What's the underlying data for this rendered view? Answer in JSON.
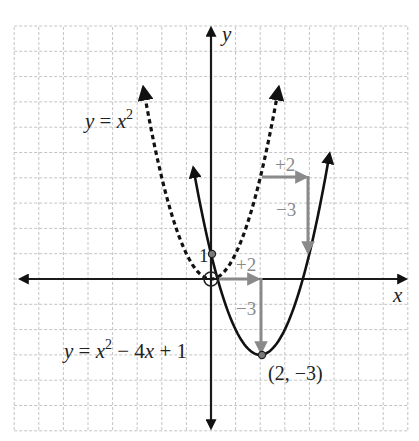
{
  "figure": {
    "axes": {
      "x_label": "x",
      "y_label": "y",
      "x_range": [
        -8,
        8
      ],
      "y_range": [
        -6,
        10
      ],
      "grid": true,
      "grid_unit": 1
    },
    "curves": [
      {
        "name": "parent",
        "equation_label": {
          "y": "y",
          "eq": " = ",
          "x": "x",
          "sup": "2"
        },
        "expression": "y = x^2",
        "style": "dashed",
        "x_domain": [
          -2.75,
          2.75
        ],
        "color": "#111111"
      },
      {
        "name": "translated",
        "equation_label": {
          "y": "y",
          "eq": " = ",
          "x": "x",
          "sup": "2",
          "rest_a": " − 4",
          "x2": "x",
          "rest_b": " + 1"
        },
        "expression": "y = x^2 - 4x + 1",
        "style": "solid",
        "x_domain": [
          -0.72,
          4.82
        ],
        "color": "#111111"
      }
    ],
    "points": {
      "origin_marker": {
        "x": 0,
        "y": 0,
        "style": "open-circle"
      },
      "y_intercept": {
        "x": 0,
        "y": 1,
        "label": "1"
      },
      "vertex": {
        "x": 2,
        "y": -3,
        "label": "(2, −3)"
      }
    },
    "translations": [
      {
        "from": [
          0,
          0
        ],
        "via": [
          2,
          0
        ],
        "to": [
          2,
          -3
        ],
        "h_label": "+2",
        "v_label": "−3",
        "color": "#8a8a8a"
      },
      {
        "from": [
          2,
          4
        ],
        "via": [
          4,
          4
        ],
        "to": [
          4,
          1
        ],
        "h_label": "+2",
        "v_label": "−3",
        "color": "#8a8a8a"
      }
    ]
  }
}
